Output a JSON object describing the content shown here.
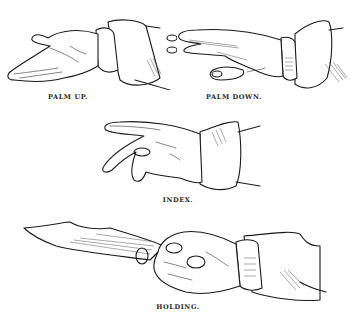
{
  "figure": {
    "panels": [
      {
        "id": "palm-up",
        "caption": "PALM UP."
      },
      {
        "id": "palm-down",
        "caption": "PALM DOWN."
      },
      {
        "id": "index",
        "caption": "INDEX."
      },
      {
        "id": "holding",
        "caption": "HOLDING."
      }
    ]
  },
  "colors": {
    "background": "#ffffff",
    "ink": "#1a1a1a"
  }
}
